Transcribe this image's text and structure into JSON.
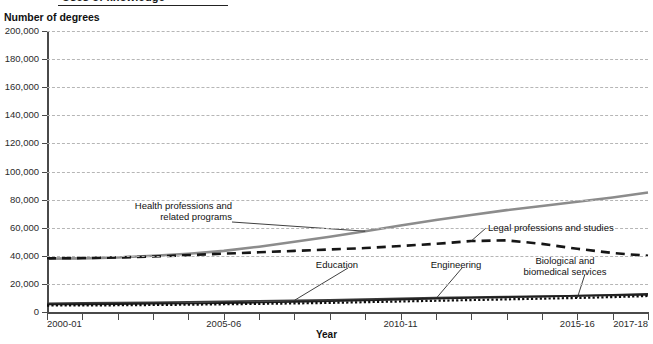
{
  "header": {
    "title": "Uses of knowledge",
    "y_axis_caption": "Number of degrees"
  },
  "chart_data": {
    "type": "line",
    "title": "Uses of knowledge",
    "xlabel": "Year",
    "ylabel": "Number of degrees",
    "ylim": [
      0,
      200000
    ],
    "ytick_values": [
      0,
      20000,
      40000,
      60000,
      80000,
      100000,
      120000,
      140000,
      160000,
      180000,
      200000
    ],
    "ytick_labels": [
      "0",
      "20,000",
      "40,000",
      "60,000",
      "80,000",
      "100,000",
      "120,000",
      "140,000",
      "160,000",
      "180,000",
      "200,000"
    ],
    "grid": true,
    "grid_style": "dashed-horizontal",
    "legend_position": "inline-annotations",
    "x": [
      "2000-01",
      "2001-02",
      "2002-03",
      "2003-04",
      "2004-05",
      "2005-06",
      "2006-07",
      "2007-08",
      "2008-09",
      "2009-10",
      "2010-11",
      "2011-12",
      "2012-13",
      "2013-14",
      "2014-15",
      "2015-16",
      "2016-17",
      "2017-18"
    ],
    "xtick_labeled": [
      "2000-01",
      "2005-06",
      "2010-11",
      "2015-16",
      "2017-18"
    ],
    "series": [
      {
        "name": "Health professions and related programs",
        "style": "solid",
        "color": "#8c8c8c",
        "width": 2.6,
        "values": [
          38000,
          38200,
          38800,
          40000,
          41500,
          43500,
          46500,
          50000,
          53500,
          57500,
          61500,
          65500,
          69000,
          72500,
          75500,
          78500,
          81500,
          85000
        ]
      },
      {
        "name": "Legal professions and studies",
        "style": "dashed",
        "color": "#161616",
        "width": 2.6,
        "values": [
          38200,
          38400,
          38800,
          39500,
          40500,
          41500,
          42500,
          43500,
          44500,
          45500,
          47000,
          48500,
          50500,
          51000,
          48500,
          45000,
          42000,
          40000
        ]
      },
      {
        "name": "Education",
        "style": "solid",
        "color": "#3a3a3a",
        "width": 1.8,
        "values": [
          6200,
          6400,
          6600,
          6900,
          7200,
          7500,
          7900,
          8300,
          8700,
          9200,
          9700,
          10200,
          10600,
          10900,
          11200,
          11500,
          11800,
          12200
        ]
      },
      {
        "name": "Engineering",
        "style": "solid",
        "color": "#1f1f1f",
        "width": 1.8,
        "values": [
          5400,
          5500,
          5700,
          5900,
          6100,
          6400,
          6800,
          7200,
          7700,
          8300,
          8900,
          9500,
          10000,
          10500,
          11000,
          11600,
          12200,
          12900
        ]
      },
      {
        "name": "Biological and biomedical services",
        "style": "dotted",
        "color": "#0d0d0d",
        "width": 2.2,
        "values": [
          4600,
          4700,
          4800,
          5000,
          5200,
          5500,
          5800,
          6100,
          6500,
          7000,
          7500,
          8000,
          8500,
          9000,
          9500,
          10000,
          10600,
          11400
        ]
      }
    ],
    "annotations": [
      {
        "text": "Health professions and\nrelated programs",
        "series": "Health professions and related programs"
      },
      {
        "text": "Legal professions and studies",
        "series": "Legal professions and studies"
      },
      {
        "text": "Education",
        "series": "Education"
      },
      {
        "text": "Engineering",
        "series": "Engineering"
      },
      {
        "text": "Biological and\nbiomedical services",
        "series": "Biological and biomedical services"
      }
    ]
  }
}
